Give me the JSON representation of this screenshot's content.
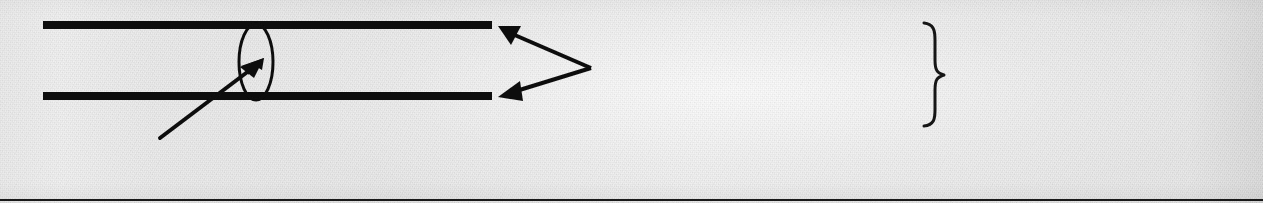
{
  "document": {
    "kind": "scanned-technical-figure",
    "page_width": 1263,
    "page_height": 203,
    "background_color": "#e9e9e9",
    "ink_color": "#101010",
    "rule_color": "#2a2a2a"
  },
  "figure": {
    "caption": "",
    "elements": {
      "upper_wall": {
        "name": "upper wall",
        "x1": 43,
        "y1": 25,
        "x2": 492,
        "y2": 25,
        "thickness": 8,
        "color": "#0d0d0d"
      },
      "lower_wall": {
        "name": "lower wall",
        "x1": 43,
        "y1": 96,
        "x2": 492,
        "y2": 96,
        "thickness": 8,
        "color": "#0d0d0d"
      },
      "callout_oval": {
        "name": "callout oval",
        "cx": 256,
        "cy": 62,
        "rx": 17,
        "ry": 38,
        "stroke_width": 3,
        "color": "#101010"
      },
      "detail_arrow": {
        "name": "detail lead arrow",
        "tail_x": 160,
        "tail_y": 138,
        "tip_x": 262,
        "tip_y": 60,
        "stroke_width": 4,
        "color": "#101010"
      },
      "forked_leader": {
        "name": "forked double-headed leader",
        "vertex_x": 591,
        "vertex_y": 68,
        "upper_tip_x": 499,
        "upper_tip_y": 26,
        "lower_tip_x": 499,
        "lower_tip_y": 97,
        "stroke_width": 4,
        "color": "#101010"
      },
      "leader_rule_left": {
        "name": "left label rule",
        "x1": 594,
        "y1": 88,
        "x2": 921,
        "y2": 88,
        "thickness": 2,
        "color": "#2b2b2b"
      },
      "brace": {
        "name": "right curly brace",
        "glyph": "}",
        "x": 924,
        "y_top": 22,
        "y_bottom": 126,
        "stroke_width": 3,
        "color": "#161616"
      },
      "leader_rule_right": {
        "name": "right label rule",
        "x1": 962,
        "y1": 88,
        "x2": 1219,
        "y2": 88,
        "thickness": 2,
        "color": "#2b2b2b"
      },
      "caption_rule": {
        "name": "caption rule",
        "x1": 57,
        "y1": 188,
        "x2": 313,
        "y2": 188,
        "thickness": 2,
        "color": "#2b2b2b"
      },
      "page_footer_rule": {
        "name": "page footer rule",
        "x1": 0,
        "y1": 200,
        "x2": 1263,
        "y2": 200,
        "thickness": 2,
        "color": "#1a1a1a"
      }
    },
    "labels": {
      "upper_wall_label": "",
      "lower_wall_label": "",
      "detail_label": "",
      "brace_label": "",
      "caption_label": ""
    }
  }
}
